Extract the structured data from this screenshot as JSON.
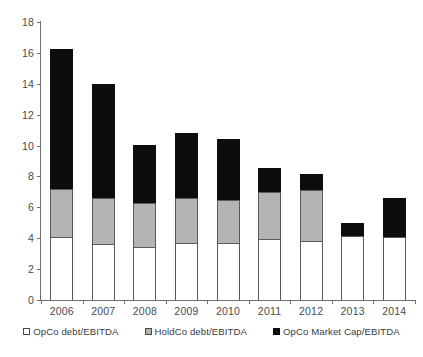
{
  "chart_data": {
    "type": "bar",
    "subtype": "stacked-vertical",
    "title": "",
    "xlabel": "",
    "ylabel": "",
    "ylim": [
      0,
      18
    ],
    "ytick_interval": 2,
    "yticks": [
      0,
      2,
      4,
      6,
      8,
      10,
      12,
      14,
      16,
      18
    ],
    "ytick_labels": [
      "0",
      "2",
      "4",
      "6",
      "8",
      "10",
      "12",
      "14",
      "16",
      "18"
    ],
    "grid": false,
    "legend_position": "bottom",
    "categories": [
      "2006",
      "2007",
      "2008",
      "2009",
      "2010",
      "2011",
      "2012",
      "2013",
      "2014"
    ],
    "series": [
      {
        "name": "OpCo debt/EBITDA",
        "color": "#ffffff",
        "values": [
          4.05,
          3.65,
          3.45,
          3.7,
          3.7,
          3.95,
          3.8,
          4.15,
          4.1
        ]
      },
      {
        "name": "HoldCo debt/EBITDA",
        "color": "#b4b4b4",
        "values": [
          3.15,
          2.95,
          2.8,
          2.9,
          2.8,
          3.05,
          3.3,
          0,
          0
        ]
      },
      {
        "name": "OpCo Market Cap/EBITDA",
        "color": "#0d0d0d",
        "values": [
          9.05,
          7.4,
          3.8,
          4.2,
          3.95,
          1.55,
          1.05,
          0.85,
          2.5
        ]
      }
    ],
    "totals": [
      16.25,
      14.0,
      10.05,
      10.8,
      10.45,
      8.55,
      8.15,
      5.0,
      6.6
    ]
  },
  "legend": {
    "items": [
      {
        "label": "OpCo debt/EBITDA",
        "swatch": "white-square-icon"
      },
      {
        "label": "HoldCo debt/EBITDA",
        "swatch": "gray-square-icon"
      },
      {
        "label": "OpCo Market Cap/EBITDA",
        "swatch": "black-square-icon"
      }
    ]
  },
  "colors": {
    "opco_debt": "#ffffff",
    "holdco_debt": "#b4b4b4",
    "market_cap": "#0d0d0d",
    "axis": "#6f6f6f",
    "text": "#3b3b3b"
  }
}
